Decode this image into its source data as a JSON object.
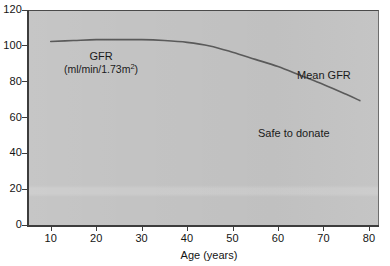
{
  "chart_data": {
    "type": "line",
    "title": "",
    "xlabel": "Age (years)",
    "ylabel": "",
    "xlim": [
      5,
      82
    ],
    "ylim": [
      0,
      120
    ],
    "grid": false,
    "legend_position": "none",
    "x_ticks": [
      10,
      20,
      30,
      40,
      50,
      60,
      70,
      80
    ],
    "y_ticks": [
      0,
      20,
      40,
      60,
      80,
      100,
      120
    ],
    "series": [
      {
        "name": "Mean GFR",
        "x": [
          10,
          15,
          20,
          25,
          30,
          35,
          40,
          45,
          50,
          55,
          60,
          65,
          70,
          75,
          78
        ],
        "values": [
          103,
          103.5,
          104,
          104,
          104,
          103.5,
          102.5,
          100.5,
          97,
          93,
          89,
          84,
          79,
          73.5,
          70
        ]
      }
    ],
    "annotations": [
      {
        "name": "gfr-axis-note",
        "title": "GFR",
        "units": "(ml/min/1.73m",
        "units_sup": "2",
        "units_tail": ")"
      },
      {
        "name": "mean-gfr-label",
        "text": "Mean GFR"
      },
      {
        "name": "safe-to-donate-label",
        "text": "Safe to donate"
      }
    ],
    "colors": {
      "plot_background": "#c3c3c3",
      "page_background": "#ffffff",
      "curve": "#5a5a5a",
      "axis": "#3d3d3d",
      "text": "#141414"
    }
  },
  "axis": {
    "x_title": "Age (years)",
    "x_tick_labels": [
      "10",
      "20",
      "30",
      "40",
      "50",
      "60",
      "70",
      "80"
    ],
    "y_tick_labels": [
      "0",
      "20",
      "40",
      "60",
      "80",
      "100",
      "120"
    ]
  },
  "annotations": {
    "gfr_title": "GFR",
    "gfr_units_prefix": "(ml/min/1.73m",
    "gfr_units_sup": "2",
    "gfr_units_suffix": ")",
    "mean_gfr": "Mean GFR",
    "safe_to_donate": "Safe to donate"
  }
}
